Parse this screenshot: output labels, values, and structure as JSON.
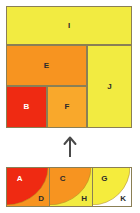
{
  "figure": {
    "background_color": "#ffffff",
    "border_color": "#8a7f55"
  },
  "colors": {
    "red": "#ef2a12",
    "orange": "#f79420",
    "orange_light": "#f9a82b",
    "yellow": "#f2eb41",
    "yellow_bright": "#f5ec3d",
    "white": "#ffffff",
    "outline": "#8a7f55",
    "arrow": "#4a4a4a"
  },
  "top_dissection": {
    "name": "squared-rectangle",
    "cells": [
      {
        "label": "I",
        "color": "#f2eb41",
        "label_color": "dark",
        "x": 0,
        "y": 0,
        "w": 126,
        "h": 39
      },
      {
        "label": "E",
        "color": "#f79420",
        "label_color": "dark",
        "x": 0,
        "y": 39,
        "w": 81,
        "h": 41
      },
      {
        "label": "J",
        "color": "#f2eb41",
        "label_color": "dark",
        "x": 81,
        "y": 39,
        "w": 45,
        "h": 83
      },
      {
        "label": "B",
        "color": "#ef2a12",
        "label_color": "light",
        "x": 0,
        "y": 80,
        "w": 41,
        "h": 42
      },
      {
        "label": "F",
        "color": "#f9a82b",
        "label_color": "dark",
        "x": 41,
        "y": 80,
        "w": 40,
        "h": 42
      }
    ]
  },
  "arrow": {
    "name": "up-arrow",
    "direction": "up",
    "color": "#4a4a4a"
  },
  "bottom_row": {
    "name": "quarter-circle-row",
    "cells": [
      {
        "inner_label": "A",
        "outer_label": "D",
        "inner_color": "#ef2a12",
        "outer_color": "#f79420",
        "inner_label_color": "light",
        "outer_label_color": "dark",
        "x": 0,
        "w": 44
      },
      {
        "inner_label": "C",
        "outer_label": "H",
        "inner_color": "#f79420",
        "outer_color": "#f2eb41",
        "inner_label_color": "dark",
        "outer_label_color": "dark",
        "x": 43,
        "w": 44
      },
      {
        "inner_label": "G",
        "outer_label": "K",
        "inner_color": "#f5ec3d",
        "outer_color": "#ffffff",
        "inner_label_color": "dark",
        "outer_label_color": "dark",
        "x": 86,
        "w": 40
      }
    ]
  }
}
